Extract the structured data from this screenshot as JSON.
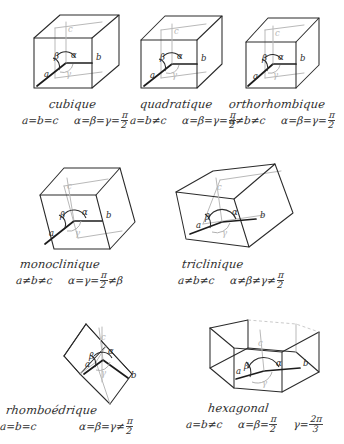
{
  "page": {
    "language": "fr",
    "ink_color": "#2b2b2b",
    "faint_ink_color": "#b9b9b9",
    "paper_color": "#ffffff"
  },
  "axis_labels": {
    "a": "a",
    "b": "b",
    "c": "c",
    "alpha": "α",
    "beta": "β",
    "gamma": "γ"
  },
  "systems": [
    {
      "id": "cubique",
      "name": "cubique",
      "shape": "cube",
      "edges": "a=b=c",
      "edges_parts": [
        "a",
        "=",
        "b",
        "=",
        "c"
      ],
      "angles_prefix": "α=β=γ=",
      "angles_value_num": "π",
      "angles_value_den": "2",
      "angles_full": "α=β=γ=π/2",
      "angles_suffix": ""
    },
    {
      "id": "quadratique",
      "name": "quadratique",
      "shape": "tetragonal-prism",
      "edges": "a=b≠c",
      "edges_parts": [
        "a",
        "=",
        "b",
        "≠",
        "c"
      ],
      "angles_prefix": "α=β=γ=",
      "angles_value_num": "π",
      "angles_value_den": "2",
      "angles_full": "α=β=γ=π/2",
      "angles_suffix": ""
    },
    {
      "id": "orthorhombique",
      "name": "orthorhombique",
      "shape": "orthorhombic-prism",
      "edges": "a≠b≠c",
      "edges_parts": [
        "a",
        "≠",
        "b",
        "≠",
        "c"
      ],
      "angles_prefix": "α=β=γ=",
      "angles_value_num": "π",
      "angles_value_den": "2",
      "angles_full": "α=β=γ=π/2",
      "angles_suffix": ""
    },
    {
      "id": "monoclinique",
      "name": "monoclinique",
      "shape": "monoclinic-prism",
      "edges": "a≠b≠c",
      "edges_parts": [
        "a",
        "≠",
        "b",
        "≠",
        "c"
      ],
      "angles_prefix": "α=γ=",
      "angles_value_num": "π",
      "angles_value_den": "2",
      "angles_full": "α=γ=π/2≠β",
      "angles_suffix": "≠β"
    },
    {
      "id": "triclinique",
      "name": "triclinique",
      "shape": "triclinic-parallelepiped",
      "edges": "a≠b≠c",
      "edges_parts": [
        "a",
        "≠",
        "b",
        "≠",
        "c"
      ],
      "angles_prefix": "α≠β≠γ≠",
      "angles_value_num": "π",
      "angles_value_den": "2",
      "angles_full": "α≠β≠γ≠π/2",
      "angles_suffix": ""
    },
    {
      "id": "rhomboedrique",
      "name": "rhomboédrique",
      "shape": "rhombohedron",
      "edges": "a=b=c",
      "edges_parts": [
        "a",
        "=",
        "b",
        "=",
        "c"
      ],
      "angles_prefix": "α=β=γ≠",
      "angles_value_num": "π",
      "angles_value_den": "2",
      "angles_full": "α=β=γ≠π/2",
      "angles_suffix": ""
    },
    {
      "id": "hexagonal",
      "name": "hexagonal",
      "shape": "hexagonal-prism",
      "edges": "a=b≠c",
      "edges_parts": [
        "a",
        "=",
        "b",
        "≠",
        "c"
      ],
      "angles_prefix": "α=β=",
      "angles_value_num": "π",
      "angles_value_den": "2",
      "angles_full": "α=β=π/2   γ=2π/3",
      "angles_suffix": "",
      "extra_prefix": "γ=",
      "extra_num": "2π",
      "extra_den": "3"
    }
  ]
}
